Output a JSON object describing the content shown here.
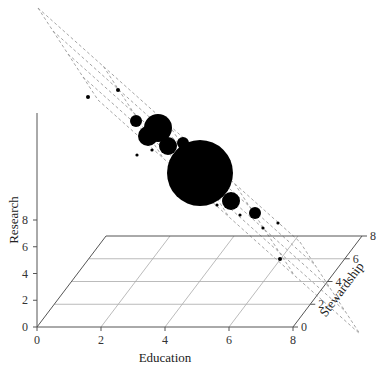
{
  "chart_data": {
    "type": "scatter",
    "subtype": "3d-bubble",
    "title": "",
    "xlabel": "Education",
    "ylabel": "Research",
    "zlabel": "Stewardship",
    "xlim": [
      0,
      8
    ],
    "ylim": [
      0,
      8
    ],
    "zlim": [
      0,
      8
    ],
    "xticks": [
      "0",
      "2",
      "4",
      "6",
      "8"
    ],
    "yticks": [
      "0",
      "2",
      "4",
      "6",
      "8"
    ],
    "zticks": [
      "0",
      "2",
      "4",
      "6",
      "8"
    ],
    "grid": true,
    "legend": null,
    "annotations": [
      "dashed regression plane through bubble cloud"
    ],
    "points_screen": [
      {
        "x": 88,
        "y": 97,
        "r": 2
      },
      {
        "x": 118,
        "y": 90,
        "r": 2
      },
      {
        "x": 136,
        "y": 121,
        "r": 6
      },
      {
        "x": 158,
        "y": 128,
        "r": 14
      },
      {
        "x": 148,
        "y": 136,
        "r": 10
      },
      {
        "x": 168,
        "y": 146,
        "r": 9
      },
      {
        "x": 183,
        "y": 143,
        "r": 6
      },
      {
        "x": 200,
        "y": 173,
        "r": 33
      },
      {
        "x": 231,
        "y": 201,
        "r": 9
      },
      {
        "x": 255,
        "y": 213,
        "r": 6
      },
      {
        "x": 137,
        "y": 155,
        "r": 1.6
      },
      {
        "x": 152,
        "y": 150,
        "r": 1.6
      },
      {
        "x": 217,
        "y": 205,
        "r": 1.6
      },
      {
        "x": 240,
        "y": 215,
        "r": 1.6
      },
      {
        "x": 263,
        "y": 228,
        "r": 1.6
      },
      {
        "x": 278,
        "y": 223,
        "r": 1.6
      },
      {
        "x": 280,
        "y": 259,
        "r": 2
      }
    ]
  },
  "labels": {
    "x_title": "Education",
    "y_title": "Research",
    "z_title": "Stewardship"
  }
}
